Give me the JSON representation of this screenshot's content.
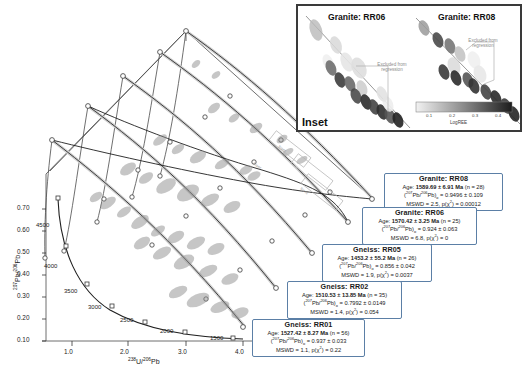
{
  "figure": {
    "type": "stacked-3d-tera-wasserburg-concordia",
    "axes": {
      "x_label_html": "<sup>238</sup>U/<sup>206</sup>Pb",
      "y_label_html": "<sup>207</sup>Pb/<sup>206</sup>Pb",
      "x_ticks": [
        "1.0",
        "2.0",
        "3.0",
        "4.0"
      ],
      "y_ticks": [
        "0.10",
        "0.20",
        "0.30",
        "0.40",
        "0.50",
        "0.60",
        "0.70"
      ],
      "xlim": [
        0.6,
        4.4
      ],
      "ylim": [
        0.06,
        0.78
      ]
    },
    "concordia_age_ticks": [
      "4500",
      "4000",
      "3500",
      "3000",
      "2500",
      "2000",
      "1500"
    ],
    "inset_flags": [
      "Inset",
      "Inset",
      "Inset"
    ]
  },
  "chart_data": {
    "type": "scatter",
    "title": "",
    "xlabel": "238U/206Pb",
    "ylabel": "207Pb/206Pb",
    "xlim": [
      0.6,
      4.4
    ],
    "ylim": [
      0.06,
      0.78
    ],
    "grid": false,
    "legend_position": "callouts-right",
    "series": [
      {
        "name": "Gneiss: RR01",
        "age_ma": 1527.42,
        "age_err": 8.27,
        "n": 56,
        "pb_ratio_0": 0.937,
        "pb_ratio_err": 0.033,
        "mswd": 1.1,
        "p_chi2": 0.22
      },
      {
        "name": "Gneiss: RR02",
        "age_ma": 1510.53,
        "age_err": 13.85,
        "n": 35,
        "pb_ratio_0": 0.7992,
        "pb_ratio_err": 0.0149,
        "mswd": 1.4,
        "p_chi2": 0.054
      },
      {
        "name": "Gneiss: RR05",
        "age_ma": 1453.2,
        "age_err": 55.2,
        "n": 26,
        "pb_ratio_0": 0.856,
        "pb_ratio_err": 0.042,
        "mswd": 1.9,
        "p_chi2": 0.0037
      },
      {
        "name": "Granite: RR06",
        "age_ma": 1570.42,
        "age_err": 3.25,
        "n": 25,
        "pb_ratio_0": 0.924,
        "pb_ratio_err": 0.063,
        "mswd": 6.8,
        "p_chi2": 0
      },
      {
        "name": "Granite: RR08",
        "age_ma": 1589.69,
        "age_err": 6.91,
        "n": 28,
        "pb_ratio_0": 0.9496,
        "pb_ratio_err": 0.109,
        "mswd": 2.5,
        "p_chi2": 0.00012
      }
    ]
  },
  "callouts": [
    {
      "title": "Granite: RR08",
      "age_html": "Age: <b>1589.69 &plusmn; 6.91 Ma</b> (n = 28)",
      "ratio_html": "(<sup>207</sup>Pb/<sup>206</sup>Pb)<sub>o</sub> = 0.9496 &plusmn; 0.109",
      "mswd_html": "MSWD = 2.5, p(&chi;<sup>2</sup>) = 0.00012"
    },
    {
      "title": "Granite: RR06",
      "age_html": "Age: <b>1570.42 &plusmn; 3.25 Ma</b> (n = 25)",
      "ratio_html": "(<sup>207</sup>Pb/<sup>206</sup>Pb)<sub>o</sub> = 0.924 &plusmn; 0.063",
      "mswd_html": "MSWD = 6.8, p(&chi;<sup>2</sup>) = 0"
    },
    {
      "title": "Gneiss: RR05",
      "age_html": "Age: <b>1453.2 &plusmn; 55.2 Ma</b> (n = 26)",
      "ratio_html": "(<sup>207</sup>Pb/<sup>206</sup>Pb)<sub>o</sub> = 0.856 &plusmn; 0.042",
      "mswd_html": "MSWD = 1.9, p(&chi;<sup>2</sup>) = 0.0037"
    },
    {
      "title": "Gneiss: RR02",
      "age_html": "Age: <b>1510.53 &plusmn; 13.85 Ma</b> (n = 35)",
      "ratio_html": "(<sup>207</sup>Pb/<sup>206</sup>Pb)<sub>o</sub> = 0.7992 &plusmn; 0.0149",
      "mswd_html": "MSWD = 1.4, p(&chi;<sup>2</sup>) = 0.054"
    },
    {
      "title": "Gneiss: RR01",
      "age_html": "Age: <b>1527.42 &plusmn; 8.27 Ma</b> (n = 56)",
      "ratio_html": "(<sup>207</sup>Pb/<sup>206</sup>Pb)<sub>o</sub> = 0.937 &plusmn; 0.033",
      "mswd_html": "MSWD = 1.1, p(&chi;<sup>2</sup>) = 0.22"
    }
  ],
  "inset": {
    "label": "Inset",
    "title_left": "Granite: RR06",
    "title_right": "Granite: RR08",
    "annotation_left": "Excluded from regression",
    "annotation_right": "Excluded from regression",
    "colorbar": {
      "label": "LogREE",
      "ticks": [
        "0.1",
        "0.2",
        "0.3",
        "0.4"
      ]
    }
  }
}
